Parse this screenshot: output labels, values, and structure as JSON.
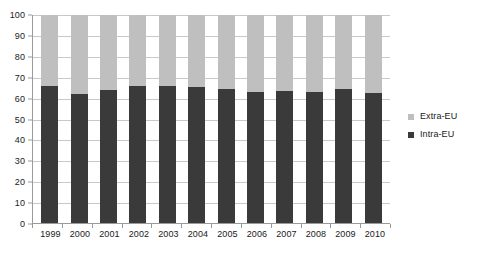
{
  "chart_data": {
    "type": "bar",
    "subtype": "stacked-100-percent",
    "title": "",
    "subtitle": "",
    "xlabel": "",
    "ylabel": "",
    "categories": [
      "1999",
      "2000",
      "2001",
      "2002",
      "2003",
      "2004",
      "2005",
      "2006",
      "2007",
      "2008",
      "2009",
      "2010"
    ],
    "series": [
      {
        "name": "Intra-EU",
        "color": "#3a3a3a",
        "values": [
          66,
          62,
          64,
          66,
          66,
          65.5,
          64.5,
          63,
          63.5,
          63,
          64.5,
          62.5
        ]
      },
      {
        "name": "Extra-EU",
        "color": "#bfbfbf",
        "values": [
          34,
          38,
          36,
          34,
          34,
          34.5,
          35.5,
          37,
          36.5,
          37,
          35.5,
          37.5
        ]
      }
    ],
    "ylim": [
      0,
      100
    ],
    "ytick_step": 10,
    "yticks": [
      0,
      10,
      20,
      30,
      40,
      50,
      60,
      70,
      80,
      90,
      100
    ],
    "ytick_labels": [
      "0",
      "10",
      "20",
      "30",
      "40",
      "50",
      "60",
      "70",
      "80",
      "90",
      "100"
    ],
    "grid": true,
    "grid_axis": "y",
    "legend": {
      "position": "right",
      "entries": [
        {
          "label": "Extra-EU",
          "color": "#bfbfbf"
        },
        {
          "label": "Intra-EU",
          "color": "#3a3a3a"
        }
      ]
    },
    "colors": {
      "intra_eu": "#3a3a3a",
      "extra_eu": "#bfbfbf",
      "gridline": "#c8c8c8",
      "axis": "#9a9a9a",
      "background": "#ffffff",
      "text": "#1a1a1a"
    }
  }
}
